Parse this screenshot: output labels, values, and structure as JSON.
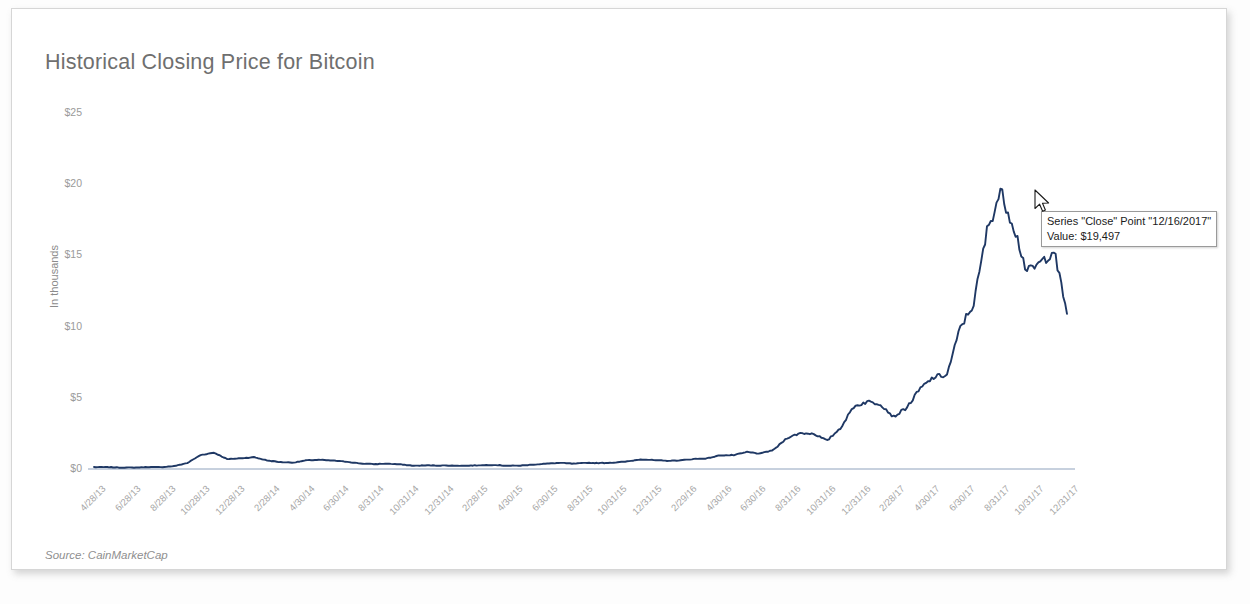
{
  "card": {
    "title": "Historical Closing Price for Bitcoin",
    "source": "Source: CainMarketCap"
  },
  "tooltip": {
    "line1": "Series \"Close\" Point \"12/16/2017\"",
    "line2": "Value:  $19,497",
    "series_name": "Close",
    "point_date": "12/16/2017",
    "point_value": "$19,497"
  },
  "colors": {
    "line": "#1f3864",
    "title": "#6f6f6f",
    "tick": "#a6a6a6",
    "card_border": "#d6d6d6",
    "background": "#ffffff"
  },
  "chart_data": {
    "type": "line",
    "title": "Historical Closing Price for Bitcoin",
    "xlabel": "",
    "ylabel": "In thousands",
    "ylim": [
      0,
      25
    ],
    "ytick_labels": [
      "$0",
      "$5",
      "$10",
      "$15",
      "$20",
      "$25"
    ],
    "ytick_values": [
      0,
      5,
      10,
      15,
      20,
      25
    ],
    "grid": false,
    "legend": false,
    "units": "thousands of USD",
    "categories": [
      "4/28/13",
      "6/28/13",
      "8/28/13",
      "10/28/13",
      "12/28/13",
      "2/28/14",
      "4/30/14",
      "6/30/14",
      "8/31/14",
      "10/31/14",
      "12/31/14",
      "2/28/15",
      "4/30/15",
      "6/30/15",
      "8/31/15",
      "10/31/15",
      "12/31/15",
      "2/29/16",
      "4/30/16",
      "6/30/16",
      "8/31/16",
      "10/31/16",
      "12/31/16",
      "2/28/17",
      "4/30/17",
      "6/30/17",
      "8/31/17",
      "10/31/17",
      "12/31/17"
    ],
    "series": [
      {
        "name": "Close",
        "color": "#1f3864",
        "x": [
          "4/28/13",
          "5/28/13",
          "6/28/13",
          "7/28/13",
          "8/28/13",
          "9/28/13",
          "10/28/13",
          "11/12/13",
          "11/28/13",
          "12/04/13",
          "12/18/13",
          "12/28/13",
          "1/28/14",
          "2/28/14",
          "3/30/14",
          "4/30/14",
          "5/30/14",
          "6/30/14",
          "7/31/14",
          "8/31/14",
          "9/30/14",
          "10/31/14",
          "11/30/14",
          "12/31/14",
          "1/31/15",
          "2/28/15",
          "3/31/15",
          "4/30/15",
          "5/31/15",
          "6/30/15",
          "7/31/15",
          "8/31/15",
          "9/30/15",
          "10/31/15",
          "11/30/15",
          "12/31/15",
          "1/31/16",
          "2/29/16",
          "3/31/16",
          "4/30/16",
          "5/31/16",
          "6/30/16",
          "7/31/16",
          "8/31/16",
          "9/30/16",
          "10/31/16",
          "11/30/16",
          "12/31/16",
          "1/31/17",
          "2/28/17",
          "3/31/17",
          "4/30/17",
          "5/31/17",
          "6/15/17",
          "6/30/17",
          "7/16/17",
          "7/31/17",
          "8/15/17",
          "8/31/17",
          "9/02/17",
          "9/15/17",
          "9/30/17",
          "10/15/17",
          "10/31/17",
          "11/12/17",
          "11/30/17",
          "12/06/17",
          "12/11/17",
          "12/16/17",
          "12/20/17",
          "12/22/17",
          "12/25/17",
          "12/28/17",
          "12/31/17"
        ],
        "y": [
          0.134,
          0.129,
          0.105,
          0.098,
          0.135,
          0.127,
          0.198,
          0.42,
          0.98,
          1.15,
          0.69,
          0.755,
          0.83,
          0.6,
          0.48,
          0.45,
          0.62,
          0.64,
          0.59,
          0.505,
          0.385,
          0.34,
          0.378,
          0.32,
          0.228,
          0.254,
          0.245,
          0.235,
          0.23,
          0.264,
          0.285,
          0.23,
          0.238,
          0.314,
          0.377,
          0.43,
          0.37,
          0.435,
          0.416,
          0.448,
          0.531,
          0.673,
          0.625,
          0.575,
          0.609,
          0.7,
          0.745,
          0.966,
          0.97,
          1.19,
          1.08,
          1.348,
          2.19,
          2.52,
          2.48,
          1.99,
          2.875,
          4.38,
          4.735,
          4.58,
          3.66,
          4.34,
          5.65,
          6.44,
          6.62,
          9.95,
          11.6,
          16.7,
          19.497,
          17.1,
          13.8,
          14.45,
          15.4,
          10.9
        ]
      }
    ],
    "annotation": {
      "label": "Series \"Close\" Point \"12/16/2017\"  Value: $19,497",
      "x": "12/16/17",
      "y": 19.497
    },
    "source": "Source: CainMarketCap"
  }
}
